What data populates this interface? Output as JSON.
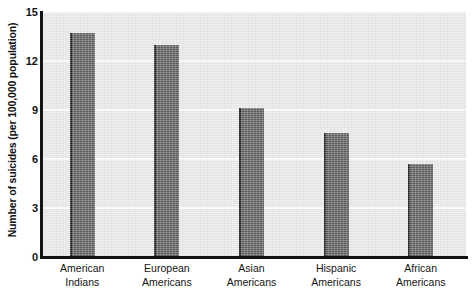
{
  "chart_data": {
    "type": "bar",
    "title": "",
    "xlabel": "",
    "ylabel": "Number of suicides (per 100,000 population)",
    "categories": [
      "American Indians",
      "European Americans",
      "Asian Americans",
      "Hispanic Americans",
      "African Americans"
    ],
    "category_lines": [
      [
        "American",
        "Indians"
      ],
      [
        "European",
        "Americans"
      ],
      [
        "Asian",
        "Americans"
      ],
      [
        "Hispanic",
        "Americans"
      ],
      [
        "African",
        "Americans"
      ]
    ],
    "values": [
      13.7,
      13.0,
      9.1,
      7.6,
      5.7
    ],
    "ylim": [
      0,
      15
    ],
    "yticks": [
      0,
      3,
      6,
      9,
      12,
      15
    ],
    "ytick_labels": [
      "0",
      "3",
      "6",
      "9",
      "12",
      "15"
    ],
    "grid": true,
    "grid_axis": "y",
    "legend": false,
    "bar_color": "#5c5c5c",
    "bar_edge_color": "#17171a",
    "plot_background": "#e9e9e9",
    "gridline_color": "#fbfbfb",
    "axis_color": "#141414"
  },
  "axis": {
    "y_title": "Number of suicides (per 100,000 population)"
  }
}
